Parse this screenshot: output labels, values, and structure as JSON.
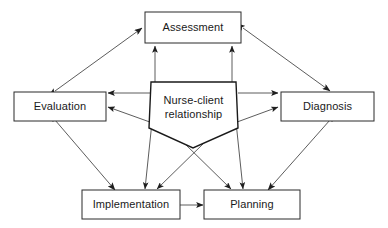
{
  "diagram": {
    "background_color": "#ffffff",
    "line_color": "#4a4a4a",
    "box_stroke_color": "#2b2b2b",
    "text_color": "#1a1a1a",
    "nodes": {
      "assessment": {
        "label": "Assessment"
      },
      "evaluation": {
        "label": "Evaluation"
      },
      "diagnosis": {
        "label": "Diagnosis"
      },
      "implementation": {
        "label": "Implementation"
      },
      "planning": {
        "label": "Planning"
      },
      "center": {
        "label_line1": "Nurse-client",
        "label_line2": "relationship"
      }
    },
    "connections": [
      {
        "from": "evaluation",
        "to": "assessment",
        "arrows": "both"
      },
      {
        "from": "assessment",
        "to": "diagnosis",
        "arrows": "both"
      },
      {
        "from": "evaluation",
        "to": "implementation",
        "arrows": "both"
      },
      {
        "from": "diagnosis",
        "to": "planning",
        "arrows": "both"
      },
      {
        "from": "implementation",
        "to": "planning",
        "arrows": "both"
      },
      {
        "from": "center",
        "to": "assessment",
        "arrows": "single"
      },
      {
        "from": "center",
        "to": "evaluation",
        "arrows": "single"
      },
      {
        "from": "center",
        "to": "diagnosis",
        "arrows": "single"
      },
      {
        "from": "center",
        "to": "implementation",
        "arrows": "single"
      },
      {
        "from": "center",
        "to": "planning",
        "arrows": "single"
      }
    ]
  }
}
